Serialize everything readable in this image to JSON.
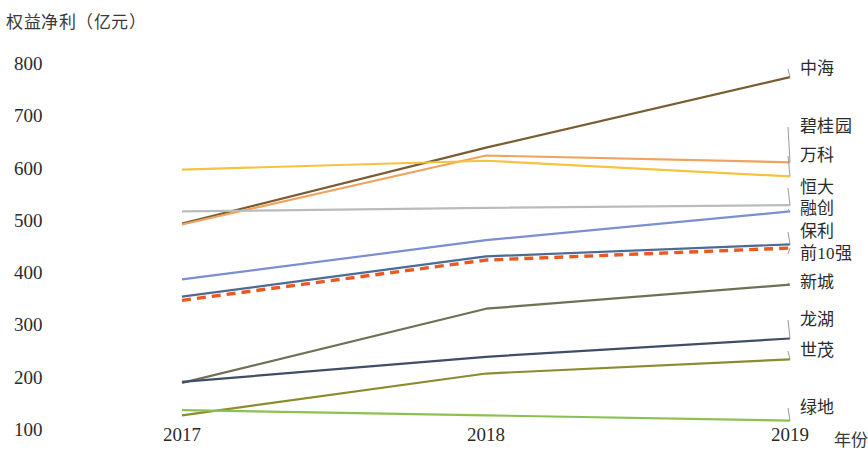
{
  "chart_data": {
    "type": "line",
    "title": "权益净利（亿元）",
    "xlabel": "年份",
    "ylabel": "",
    "categories": [
      "2017",
      "2018",
      "2019"
    ],
    "x": [
      2017,
      2018,
      2019
    ],
    "ylim": [
      100,
      800
    ],
    "yticks": [
      "800",
      "700",
      "600",
      "500",
      "400",
      "300",
      "200",
      "100"
    ],
    "ytick_values": [
      800,
      700,
      600,
      500,
      400,
      300,
      200,
      100
    ],
    "grid": false,
    "legend_position": "right",
    "series": [
      {
        "name": "中海",
        "values": [
          495,
          640,
          775
        ],
        "color": "#7a5c32",
        "style": "solid",
        "label_y": 69
      },
      {
        "name": "碧桂园",
        "values": [
          493,
          625,
          612
        ],
        "color": "#f0a35e",
        "style": "solid",
        "label_y": 127
      },
      {
        "name": "万科",
        "values": [
          598,
          615,
          585
        ],
        "color": "#f5c342",
        "style": "solid",
        "label_y": 156
      },
      {
        "name": "恒大",
        "values": [
          518,
          525,
          530
        ],
        "color": "#b9bcbd",
        "style": "solid",
        "label_y": 188
      },
      {
        "name": "融创",
        "values": [
          388,
          463,
          518
        ],
        "color": "#7b8fd0",
        "style": "solid",
        "label_y": 209
      },
      {
        "name": "保利",
        "values": [
          355,
          432,
          455
        ],
        "color": "#4a6b96",
        "style": "solid",
        "label_y": 232
      },
      {
        "name": "前10强",
        "values": [
          348,
          425,
          448
        ],
        "color": "#ea5a20",
        "style": "dashed",
        "label_y": 254
      },
      {
        "name": "新城",
        "values": [
          190,
          332,
          378
        ],
        "color": "#6e7154",
        "style": "solid",
        "label_y": 283
      },
      {
        "name": "龙湖",
        "values": [
          192,
          240,
          275
        ],
        "color": "#3f4d66",
        "style": "solid",
        "label_y": 320
      },
      {
        "name": "世茂",
        "values": [
          128,
          208,
          235
        ],
        "color": "#8a8c2e",
        "style": "solid",
        "label_y": 351
      },
      {
        "name": "绿地",
        "values": [
          138,
          128,
          118
        ],
        "color": "#8cc152",
        "style": "solid",
        "label_y": 408
      }
    ]
  },
  "axes": {
    "y_title": "权益净利（亿元）",
    "x_title": "年份",
    "x_labels": [
      "2017",
      "2018",
      "2019"
    ],
    "y_labels": [
      "800",
      "700",
      "600",
      "500",
      "400",
      "300",
      "200",
      "100"
    ]
  }
}
